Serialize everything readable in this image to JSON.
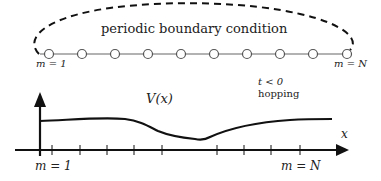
{
  "diagram": {
    "title": "periodic boundary condition",
    "chain": {
      "node_count": 10,
      "first_label": "m = 1",
      "last_label": "m = N",
      "hopping_condition": "t < 0",
      "hopping_label": "hopping"
    },
    "potential": {
      "curve_label": "V(x)",
      "x_axis_label": "x",
      "first_site_label": "m = 1",
      "last_site_label": "m = N",
      "tick_count": 9
    },
    "colors": {
      "line": "#111111",
      "chain_line": "#666666",
      "node_fill": "#ffffff",
      "node_stroke": "#555555"
    }
  }
}
